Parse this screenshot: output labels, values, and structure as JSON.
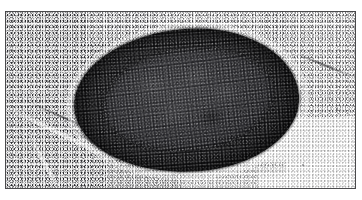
{
  "figure": {
    "kind": "histology-micrograph",
    "title": "Lymph node surrounded by adipose tissue",
    "color_mode": "grayscale",
    "frame_color": "#4a4a4c",
    "background_color": "#ffffff",
    "canvas": {
      "width": 362,
      "height": 200
    },
    "plate": {
      "x": 5,
      "y": 11,
      "width": 351,
      "height": 178
    }
  },
  "regions": [
    {
      "name": "adipose-upper-left",
      "label": "Adipose tissue (upper left)",
      "tone": "dense",
      "x": 0,
      "y": 0,
      "width": 150,
      "height": 95
    },
    {
      "name": "adipose-lower-left",
      "label": "Adipose tissue (lower left)",
      "tone": "dense",
      "x": 0,
      "y": 80,
      "width": 175,
      "height": 98
    },
    {
      "name": "adipose-upper-right",
      "label": "Adipose tissue (upper right)",
      "tone": "sparse",
      "x": 255,
      "y": 0,
      "width": 96,
      "height": 105
    },
    {
      "name": "adipose-top-band",
      "label": "Adipose tissue (top band)",
      "tone": "sparse",
      "x": 80,
      "y": 0,
      "width": 200,
      "height": 30
    },
    {
      "name": "adipose-bottom-band",
      "label": "Adipose tissue (bottom band)",
      "tone": "faint",
      "x": 100,
      "y": 150,
      "width": 180,
      "height": 28
    },
    {
      "name": "clear-field-lower-right",
      "label": "Clear background (lower right)",
      "tone": "blank",
      "x": 252,
      "y": 104,
      "width": 99,
      "height": 74
    }
  ],
  "lymph_node": {
    "name": "lymph-node",
    "label": "Lymph node",
    "x": 68,
    "y": 17,
    "width": 225,
    "height": 143,
    "rotation_deg": -4,
    "capsule_label": "Capsule / cortex",
    "medulla_label": "Medulla (inner oval)",
    "follicle_count": 5
  },
  "septa": [
    {
      "name": "septum-lower-left-diagonal",
      "x": -10,
      "y": 120,
      "width": 130,
      "height": 4,
      "rotation_deg": 26
    },
    {
      "name": "septum-left-vertical",
      "x": 4,
      "y": 150,
      "width": 70,
      "height": 3,
      "rotation_deg": 62
    },
    {
      "name": "septum-below-node",
      "x": 120,
      "y": 157,
      "width": 120,
      "height": 4,
      "rotation_deg": -3
    }
  ],
  "dark_streaks": [
    {
      "name": "streak-lower-left-vessel",
      "x": 20,
      "y": 108,
      "width": 90,
      "height": 2,
      "rotation_deg": 24
    },
    {
      "name": "streak-left-mid",
      "x": 55,
      "y": 132,
      "width": 70,
      "height": 2,
      "rotation_deg": 35
    },
    {
      "name": "streak-upper-right",
      "x": 288,
      "y": 52,
      "width": 60,
      "height": 2,
      "rotation_deg": 22
    }
  ],
  "specks": [
    {
      "name": "speck-lower-right",
      "x": 296,
      "y": 152,
      "size": 2
    },
    {
      "name": "speck-right-margin",
      "x": 330,
      "y": 96,
      "size": 1.5
    }
  ]
}
